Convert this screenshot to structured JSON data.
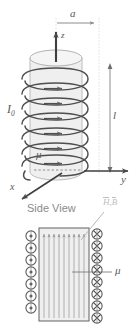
{
  "figure": {
    "width": 136,
    "height": 333,
    "background": "#ffffff"
  },
  "colors": {
    "stroke_dark": "#4a4a4c",
    "stroke_mid": "#6e6e70",
    "stroke_light": "#b9b9bb",
    "cylinder_fill": "#f2f2f2",
    "cylinder_side_fill": "#ececec",
    "box_fill": "#f0f0f0",
    "label_gray": "#58585a",
    "sideview_gray": "#8a8a8c",
    "hb_gray": "#bdbdbf",
    "dashed_gray": "#9a9a9c"
  },
  "perspective_view": {
    "labels": {
      "radius": "a",
      "axis_z": "z",
      "current": "I",
      "current_sub": "0",
      "permeability": "μ",
      "length": "l",
      "axis_x": "x",
      "axis_y": "y"
    },
    "coil_turns": 7,
    "coil_arrow_count": 6,
    "cylinder": {
      "center_x": 56,
      "top_y": 58,
      "bottom_y": 172,
      "radius_x": 26,
      "radius_y": 8
    }
  },
  "side_view": {
    "caption": "Side View",
    "field_label": "H, B",
    "field_label_h": "H",
    "field_label_b": "B",
    "permeability": "μ",
    "left_symbols": {
      "glyph": "dot-in-circle",
      "meaning": "current out of page",
      "count": 7
    },
    "right_symbols": {
      "glyph": "cross-in-circle",
      "meaning": "current into page",
      "count": 8
    },
    "field_lines": 9,
    "box": {
      "x": 39,
      "y": 228,
      "width": 50,
      "height": 93
    }
  }
}
